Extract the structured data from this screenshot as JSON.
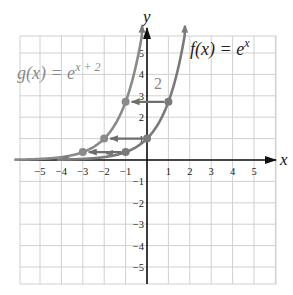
{
  "chart_data": {
    "type": "line",
    "title": "",
    "xlabel": "x",
    "ylabel": "y",
    "xlim": [
      -6,
      6
    ],
    "ylim": [
      -6,
      6
    ],
    "grid": true,
    "x_ticks": [
      -5,
      -4,
      -3,
      -2,
      -1,
      1,
      2,
      3,
      4,
      5
    ],
    "y_ticks": [
      -5,
      -4,
      -3,
      -2,
      -1,
      1,
      2,
      3,
      4,
      5
    ],
    "series": [
      {
        "name": "f(x) = e^x",
        "label_main": "f(x) = e",
        "label_exp": "x",
        "color": "#7a7a7a",
        "points": [
          [
            -1,
            0.37
          ],
          [
            0,
            1
          ],
          [
            1,
            2.72
          ]
        ]
      },
      {
        "name": "g(x) = e^(x+2)",
        "label_main": "g(x) = e",
        "label_exp": "x + 2",
        "color": "#8a8a8a",
        "points": [
          [
            -3,
            0.37
          ],
          [
            -2,
            1
          ],
          [
            -1,
            2.72
          ]
        ]
      }
    ],
    "annotations": [
      {
        "text": "2",
        "description": "horizontal shift of 2 units left, shown by arrows from f points to g points"
      }
    ]
  }
}
